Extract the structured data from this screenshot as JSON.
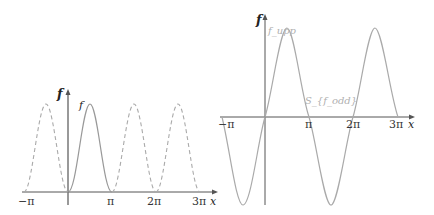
{
  "figures": {
    "left": {
      "y_axis_label": "f",
      "x_axis_label": "x",
      "curve_label": "f",
      "ticks": [
        "−π",
        "π",
        "2π",
        "3π"
      ],
      "description": "Solid half-period hump of f on [0, π]; dashed periodic continuation (period π) on [−π, 0] and [π, 3π]"
    },
    "right": {
      "y_axis_label": "f",
      "x_axis_label": "x",
      "curve_label_top": "f_upp",
      "curve_label_mid": "S_{f_odd}",
      "ticks": [
        "−π",
        "π",
        "2π",
        "3π"
      ],
      "description": "Odd extension of f, periodic with period 2π, sinusoid-like curve on [−π, 3π]"
    }
  },
  "colors": {
    "axis": "#555555",
    "curve": "#a8a8a8",
    "label": "#222222",
    "faint_label": "#b0b0b0"
  }
}
